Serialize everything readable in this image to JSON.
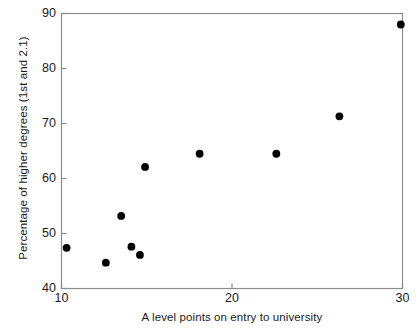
{
  "chart_data": {
    "type": "scatter",
    "title": "",
    "xlabel": "A level points on entry to university",
    "ylabel": "Percentage of higher degrees (1st and 2.1)",
    "xlim": [
      10,
      30
    ],
    "ylim": [
      40,
      90
    ],
    "xticks": [
      10,
      20,
      30
    ],
    "yticks": [
      40,
      50,
      60,
      70,
      80,
      90
    ],
    "xticklabels": [
      "10",
      "20",
      "30"
    ],
    "yticklabels": [
      "40",
      "50",
      "60",
      "70",
      "80",
      "90"
    ],
    "grid": false,
    "legend": null,
    "marker": {
      "shape": "circle",
      "color": "#000000",
      "size_px": 5
    },
    "frame_color": "#8c8c8c",
    "points": [
      {
        "x": 10.3,
        "y": 47.4
      },
      {
        "x": 12.6,
        "y": 44.7
      },
      {
        "x": 13.5,
        "y": 53.2
      },
      {
        "x": 14.1,
        "y": 47.6
      },
      {
        "x": 14.6,
        "y": 46.1
      },
      {
        "x": 14.9,
        "y": 62.1
      },
      {
        "x": 18.1,
        "y": 64.5
      },
      {
        "x": 22.6,
        "y": 64.5
      },
      {
        "x": 26.3,
        "y": 71.3
      },
      {
        "x": 29.9,
        "y": 88.0
      }
    ]
  },
  "axes": {
    "x_tick_labels": [
      {
        "value": 10,
        "label": "10"
      },
      {
        "value": 20,
        "label": "20"
      },
      {
        "value": 30,
        "label": "30"
      }
    ],
    "y_tick_labels": [
      {
        "value": 90,
        "label": "90"
      },
      {
        "value": 80,
        "label": "80"
      },
      {
        "value": 70,
        "label": "70"
      },
      {
        "value": 60,
        "label": "60"
      },
      {
        "value": 50,
        "label": "50"
      },
      {
        "value": 40,
        "label": "40"
      }
    ]
  }
}
